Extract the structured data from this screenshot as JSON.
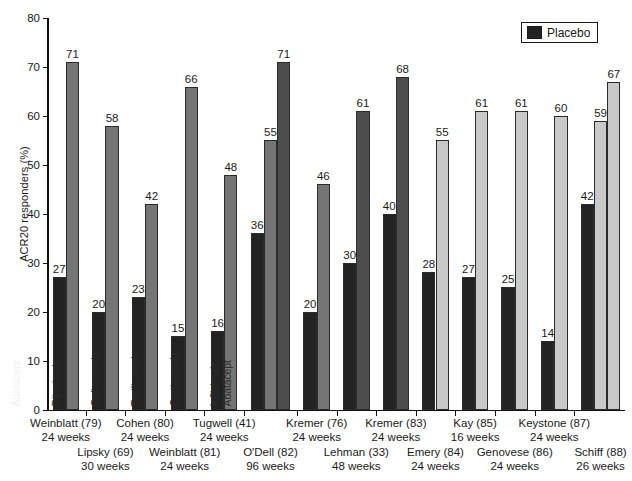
{
  "legend": {
    "label": "Placebo",
    "swatch_color": "#232323"
  },
  "colors": {
    "placebo": "#232323",
    "treatment_dark": "#4d4d4d",
    "treatment_mid": "#757575",
    "treatment_light": "#c9c9c9",
    "axis": "#111111",
    "background": "#ffffff"
  },
  "chart_data": {
    "type": "bar",
    "title": "",
    "xlabel": "",
    "ylabel": "ACR20 responders (%)",
    "ylim": [
      0,
      80
    ],
    "yticks": [
      0,
      10,
      20,
      30,
      40,
      50,
      60,
      70,
      80
    ],
    "grid": false,
    "legend_position": "top-right",
    "legend_entries": [
      "Placebo"
    ],
    "groups": [
      {
        "study": "Weinblatt (79)",
        "duration": "24 weeks",
        "row": 0,
        "bars": [
          {
            "name": "",
            "label": "",
            "value": 27,
            "series": "Placebo",
            "shade": "placebo"
          },
          {
            "name": "Etanercept",
            "label": "Etanercept",
            "value": 71,
            "series": "Treatment",
            "shade": "treatment_mid"
          }
        ]
      },
      {
        "study": "Lipsky (69)",
        "duration": "30 weeks",
        "row": 1,
        "bars": [
          {
            "name": "",
            "label": "",
            "value": 20,
            "series": "Placebo",
            "shade": "placebo"
          },
          {
            "name": "Infliximab",
            "label": "Infliximab",
            "value": 58,
            "series": "Treatment",
            "shade": "treatment_mid"
          }
        ]
      },
      {
        "study": "Cohen (80)",
        "duration": "24 weeks",
        "row": 0,
        "bars": [
          {
            "name": "",
            "label": "",
            "value": 23,
            "series": "Placebo",
            "shade": "placebo"
          },
          {
            "name": "Anakinra",
            "label": "Anakinra",
            "value": 42,
            "series": "Treatment",
            "shade": "treatment_mid"
          }
        ]
      },
      {
        "study": "Weinblatt (81)",
        "duration": "24 weeks",
        "row": 1,
        "bars": [
          {
            "name": "",
            "label": "",
            "value": 15,
            "series": "Placebo",
            "shade": "placebo"
          },
          {
            "name": "Adalimumab",
            "label": "Adalimumab",
            "value": 66,
            "series": "Treatment",
            "shade": "treatment_mid"
          }
        ]
      },
      {
        "study": "Tugwell (41)",
        "duration": "24 weeks",
        "row": 0,
        "bars": [
          {
            "name": "",
            "label": "",
            "value": 16,
            "series": "Placebo",
            "shade": "placebo"
          },
          {
            "name": "CSA",
            "label": "CSA",
            "value": 48,
            "series": "Treatment",
            "shade": "treatment_mid"
          }
        ]
      },
      {
        "study": "O'Dell (82)",
        "duration": "96 weeks",
        "row": 1,
        "bars": [
          {
            "name": "SSZ",
            "label": "SSZ",
            "value": 36,
            "series": "Treatment",
            "shade": "placebo"
          },
          {
            "name": "HCQ",
            "label": "HCQ",
            "value": 55,
            "series": "Treatment",
            "shade": "treatment_mid"
          },
          {
            "name": "SSZ and HCQ",
            "label": "SSZ and HCQ",
            "value": 71,
            "series": "Treatment",
            "shade": "treatment_dark"
          }
        ]
      },
      {
        "study": "Kremer (76)",
        "duration": "24 weeks",
        "row": 0,
        "bars": [
          {
            "name": "",
            "label": "",
            "value": 20,
            "series": "Placebo",
            "shade": "placebo"
          },
          {
            "name": "Leflunomide",
            "label": "Leflunomide",
            "value": 46,
            "series": "Treatment",
            "shade": "treatment_mid"
          }
        ]
      },
      {
        "study": "Lehman (33)",
        "duration": "48 weeks",
        "row": 1,
        "bars": [
          {
            "name": "",
            "label": "",
            "value": 30,
            "series": "Placebo",
            "shade": "placebo"
          },
          {
            "name": "Gold",
            "label": "Gold",
            "value": 61,
            "series": "Treatment",
            "shade": "treatment_dark"
          }
        ]
      },
      {
        "study": "Kremer (83)",
        "duration": "24 weeks",
        "row": 0,
        "bars": [
          {
            "name": "",
            "label": "",
            "value": 40,
            "series": "Placebo",
            "shade": "placebo"
          },
          {
            "name": "Abatacept",
            "label": "Abatacept",
            "value": 68,
            "series": "Treatment",
            "shade": "treatment_dark"
          }
        ]
      },
      {
        "study": "Emery (84)",
        "duration": "24 weeks",
        "row": 1,
        "bars": [
          {
            "name": "",
            "label": "",
            "value": 28,
            "series": "Placebo",
            "shade": "placebo"
          },
          {
            "name": "Rituximab",
            "label": "Rituximab",
            "value": 55,
            "series": "Treatment",
            "shade": "treatment_light"
          }
        ]
      },
      {
        "study": "Kay (85)",
        "duration": "16 weeks",
        "row": 0,
        "bars": [
          {
            "name": "",
            "label": "",
            "value": 27,
            "series": "Placebo",
            "shade": "placebo"
          },
          {
            "name": "Golimumab",
            "label": "Golimumab",
            "value": 61,
            "series": "Treatment",
            "shade": "treatment_light"
          }
        ]
      },
      {
        "study": "Genovese (86)",
        "duration": "24 weeks",
        "row": 1,
        "bars": [
          {
            "name": "",
            "label": "",
            "value": 25,
            "series": "Placebo",
            "shade": "placebo"
          },
          {
            "name": "Tocilizumab",
            "label": "Tocilizumab",
            "value": 61,
            "series": "Treatment",
            "shade": "treatment_light"
          }
        ]
      },
      {
        "study": "Keystone (87)",
        "duration": "24 weeks",
        "row": 0,
        "bars": [
          {
            "name": "",
            "label": "",
            "value": 14,
            "series": "Placebo",
            "shade": "placebo"
          },
          {
            "name": "Certizumab",
            "label": "Certizumab",
            "value": 60,
            "series": "Treatment",
            "shade": "treatment_light"
          }
        ]
      },
      {
        "study": "Schiff (88)",
        "duration": "26 weeks",
        "row": 1,
        "bars": [
          {
            "name": "",
            "label": "",
            "value": 42,
            "series": "Placebo",
            "shade": "placebo"
          },
          {
            "name": "Infliximab",
            "label": "Infliximab",
            "value": 59,
            "series": "Treatment",
            "shade": "treatment_light"
          },
          {
            "name": "Abatacept",
            "label": "Abatacept",
            "value": 67,
            "series": "Treatment",
            "shade": "treatment_light"
          }
        ]
      }
    ]
  }
}
